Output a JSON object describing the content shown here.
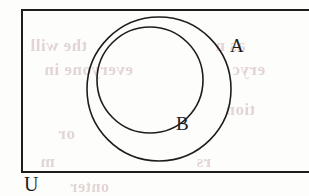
{
  "figure": {
    "type": "venn-diagram",
    "relation": "B is a proper subset of A",
    "background_color": "#fdfdfc",
    "stroke_color": "#1d1d1d",
    "label_color": "#1d1d1d"
  },
  "labels": {
    "universal_set": "U",
    "outer_set": "A",
    "inner_set": "B"
  },
  "shapes": {
    "universe_rect": {
      "name": "U",
      "x": 22,
      "y": 10,
      "width": 295,
      "height": 162,
      "stroke_width": 2
    },
    "circle_a": {
      "name": "A",
      "cx": 159,
      "cy": 89,
      "r": 72,
      "stroke_width": 1.6
    },
    "circle_b": {
      "name": "B",
      "cx": 150,
      "cy": 80,
      "r": 53,
      "stroke_width": 1.6
    }
  },
  "bleed_text": {
    "color": "#d8c6c6",
    "lines": [
      "the will",
      "everyone in",
      "as n",
      "eryc",
      "or",
      "tion",
      "m",
      "rs",
      "onter"
    ]
  }
}
